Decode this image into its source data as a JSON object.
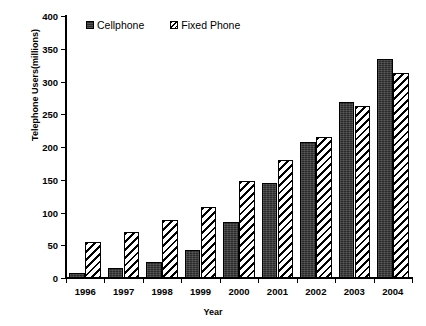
{
  "chart_data": {
    "type": "bar",
    "title": "",
    "xlabel": "Year",
    "ylabel": "Telephone Users(millions)",
    "categories": [
      "1996",
      "1997",
      "1998",
      "1999",
      "2000",
      "2001",
      "2002",
      "2003",
      "2004"
    ],
    "series": [
      {
        "name": "Cellphone",
        "values": [
          7,
          15,
          24,
          43,
          85,
          145,
          207,
          269,
          335
        ]
      },
      {
        "name": "Fixed Phone",
        "values": [
          55,
          71,
          88,
          109,
          148,
          180,
          215,
          263,
          313
        ]
      }
    ],
    "ylim": [
      0,
      400
    ],
    "yticks": [
      0,
      50,
      100,
      150,
      200,
      250,
      300,
      350,
      400
    ],
    "ytick_labels": [
      "0",
      "50",
      "100",
      "150",
      "200",
      "250",
      "300",
      "350",
      "400"
    ],
    "grid": false,
    "legend_position": "top-left-inside",
    "colors": {
      "cellphone": "#2b2b2b",
      "fixed_phone": "#ffffff",
      "axis": "#000000",
      "background": "#ffffff"
    }
  },
  "legend": {
    "items": [
      {
        "label": "Cellphone",
        "style": "solid-dark"
      },
      {
        "label": "Fixed Phone",
        "style": "diagonal-hatch"
      }
    ]
  }
}
